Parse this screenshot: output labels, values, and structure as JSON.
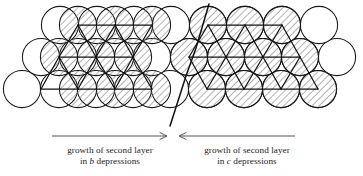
{
  "figure": {
    "background_color": "#ffffff",
    "line_color": "#1a1a1a",
    "hatch_color": "#6e6e6e",
    "text_color": "#1d1d1d"
  },
  "annotations": {
    "left": {
      "arrow_direction": "right",
      "line1": "growth of second layer",
      "line2_prefix": "in ",
      "line2_symbol": "b",
      "line2_suffix": " depressions"
    },
    "right": {
      "arrow_direction": "left",
      "line1": "growth of second layer",
      "line2_prefix": "in ",
      "line2_symbol": "c",
      "line2_suffix": " depressions"
    }
  },
  "diagram_data": {
    "type": "sphere-packing",
    "circle_radius": 18.6,
    "row_spacing": 32.2,
    "column_spacing": 37.2,
    "first_layer_style": "open",
    "second_layer_style": "hatched",
    "domain_boundary": {
      "label": "stacking-fault boundary",
      "x_top": 208,
      "y_top": 6,
      "x_bottom": 172,
      "y_bottom": 124
    },
    "rows": [
      {
        "row": 0,
        "y": 25,
        "open_circles_x": [
          60,
          97,
          134,
          171,
          208,
          245,
          282,
          319
        ],
        "hatched_circles_x": [
          78,
          115,
          152,
          208,
          245,
          282
        ]
      },
      {
        "row": 1,
        "y": 57,
        "open_circles_x": [
          41,
          78,
          115,
          152,
          189,
          226,
          263,
          300,
          337
        ],
        "hatched_circles_x": [
          59,
          96,
          133,
          189,
          226,
          263,
          300
        ]
      },
      {
        "row": 2,
        "y": 89,
        "open_circles_x": [
          22,
          59,
          96,
          133,
          170,
          207,
          244,
          281,
          318
        ],
        "hatched_circles_x": [
          78,
          115,
          152,
          207,
          244,
          281,
          318
        ]
      }
    ]
  }
}
